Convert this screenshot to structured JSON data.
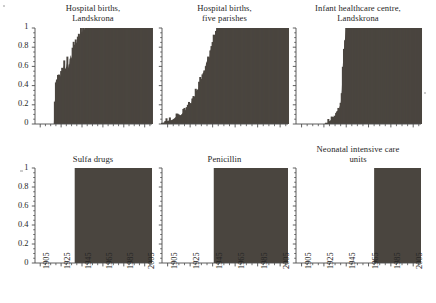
{
  "figure": {
    "background_color": "#ffffff",
    "series_fill_color": "#4a453f",
    "axis_color": "#4d4d4d",
    "text_color": "#262626"
  },
  "axes": {
    "y_ticks": [
      "0",
      "0.2",
      "0.4",
      "0.6",
      "0.8",
      "1"
    ],
    "y_values": [
      0,
      0.2,
      0.4,
      0.6,
      0.8,
      1
    ],
    "ylim": [
      0,
      1
    ],
    "x_ticks": [
      "1905",
      "1925",
      "1945",
      "1965",
      "1985",
      "2005"
    ],
    "x_values": [
      1905,
      1925,
      1945,
      1965,
      1985,
      2005
    ],
    "xlim": [
      1900,
      2012
    ],
    "x_minor_step": 5,
    "top_row_x_labels_shown": false,
    "bottom_row_x_labels_shown": true,
    "x_label_rotation_degrees": -90
  },
  "chart_data": [
    {
      "id": "hospital-births-landskrona",
      "type": "area",
      "title": "Hospital births,\nLandskrona",
      "xlabel": "",
      "ylabel": "",
      "ylim": [
        0,
        1
      ],
      "xlim": [
        1900,
        2012
      ],
      "grid": false,
      "legend": "none",
      "row": "top",
      "column": 1,
      "x": [
        1900,
        1905,
        1910,
        1915,
        1918,
        1920,
        1921,
        1922,
        1923,
        1924,
        1925,
        1926,
        1927,
        1928,
        1929,
        1930,
        1931,
        1932,
        1933,
        1934,
        1935,
        1936,
        1937,
        1938,
        1939,
        1940,
        1941,
        1942,
        1943,
        1944,
        1945,
        1946,
        1947,
        1948,
        1949,
        1950,
        1955,
        1960,
        1970,
        1980,
        1990,
        2000,
        2012
      ],
      "values": [
        0,
        0,
        0,
        0,
        0,
        0.45,
        0.46,
        0.47,
        0.5,
        0.49,
        0.52,
        0.55,
        0.58,
        0.62,
        0.57,
        0.6,
        0.66,
        0.58,
        0.63,
        0.72,
        0.68,
        0.78,
        0.82,
        0.8,
        0.86,
        0.84,
        0.9,
        0.94,
        0.91,
        0.97,
        0.95,
        0.99,
        0.98,
        1,
        1,
        1,
        1,
        1,
        1,
        1,
        1,
        1,
        1
      ]
    },
    {
      "id": "hospital-births-five-parishes",
      "type": "area",
      "title": "Hospital births,\nfive parishes",
      "xlabel": "",
      "ylabel": "",
      "ylim": [
        0,
        1
      ],
      "xlim": [
        1900,
        2012
      ],
      "grid": false,
      "legend": "none",
      "row": "top",
      "column": 2,
      "x": [
        1900,
        1903,
        1905,
        1908,
        1910,
        1912,
        1914,
        1916,
        1918,
        1920,
        1921,
        1922,
        1923,
        1924,
        1925,
        1926,
        1927,
        1928,
        1929,
        1930,
        1931,
        1932,
        1933,
        1934,
        1935,
        1936,
        1937,
        1938,
        1939,
        1940,
        1941,
        1942,
        1943,
        1944,
        1945,
        1946,
        1947,
        1948,
        1950,
        1955,
        1960,
        1970,
        1980,
        1990,
        2000,
        2012
      ],
      "values": [
        0.01,
        0.02,
        0.03,
        0.04,
        0.05,
        0.07,
        0.09,
        0.08,
        0.11,
        0.13,
        0.15,
        0.14,
        0.18,
        0.2,
        0.22,
        0.21,
        0.26,
        0.29,
        0.27,
        0.33,
        0.36,
        0.34,
        0.4,
        0.45,
        0.43,
        0.5,
        0.56,
        0.54,
        0.62,
        0.66,
        0.7,
        0.68,
        0.76,
        0.8,
        0.84,
        0.9,
        0.93,
        0.97,
        1,
        1,
        1,
        1,
        1,
        1,
        1,
        1
      ]
    },
    {
      "id": "infant-healthcare-centre-landskrona",
      "type": "area",
      "title": "Infant healthcare centre,\nLandskrona",
      "xlabel": "",
      "ylabel": "",
      "ylim": [
        0,
        1
      ],
      "xlim": [
        1900,
        2012
      ],
      "grid": false,
      "legend": "none",
      "row": "top",
      "column": 3,
      "x": [
        1900,
        1910,
        1920,
        1925,
        1928,
        1930,
        1931,
        1932,
        1933,
        1934,
        1935,
        1936,
        1937,
        1938,
        1939,
        1940,
        1941,
        1942,
        1943,
        1944,
        1945,
        1950,
        1960,
        1970,
        1980,
        1990,
        2000,
        2012
      ],
      "values": [
        0,
        0,
        0,
        0,
        0.01,
        0.03,
        0.04,
        0.06,
        0.05,
        0.09,
        0.08,
        0.12,
        0.14,
        0.13,
        0.18,
        0.2,
        0.35,
        0.62,
        0.78,
        0.9,
        1,
        1,
        1,
        1,
        1,
        1,
        1,
        1
      ]
    },
    {
      "id": "sulfa-drugs",
      "type": "step",
      "title": "Sulfa drugs",
      "xlabel": "",
      "ylabel": "",
      "ylim": [
        0,
        1
      ],
      "xlim": [
        1900,
        2012
      ],
      "grid": false,
      "legend": "none",
      "row": "bottom",
      "column": 1,
      "step_year": 1938,
      "x": [
        1900,
        1938,
        1938,
        2012
      ],
      "values": [
        0,
        0,
        1,
        1
      ]
    },
    {
      "id": "penicillin",
      "type": "step",
      "title": "Penicillin",
      "xlabel": "",
      "ylabel": "",
      "ylim": [
        0,
        1
      ],
      "xlim": [
        1900,
        2012
      ],
      "grid": false,
      "legend": "none",
      "row": "bottom",
      "column": 2,
      "step_year": 1946,
      "x": [
        1900,
        1946,
        1946,
        2012
      ],
      "values": [
        0,
        0,
        1,
        1
      ]
    },
    {
      "id": "neonatal-intensive-care-units",
      "type": "step",
      "title": "Neonatal intensive care\nunits",
      "xlabel": "",
      "ylabel": "",
      "ylim": [
        0,
        1
      ],
      "xlim": [
        1900,
        2012
      ],
      "grid": false,
      "legend": "none",
      "row": "bottom",
      "column": 3,
      "step_year": 1970,
      "x": [
        1900,
        1970,
        1970,
        2012
      ],
      "values": [
        0,
        0,
        1,
        1
      ]
    }
  ]
}
